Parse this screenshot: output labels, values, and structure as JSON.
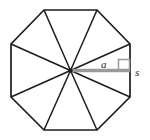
{
  "figure": {
    "name": "regular-octagon-apothem-side-diagram",
    "shape": "regular octagon",
    "sides": 8,
    "background_color": "#fefefe",
    "outline_color": "#1c1c1c",
    "radius_color": "#1c1c1c",
    "apothem_color": "#9a9a9a",
    "center": {
      "x": 70.5,
      "y": 70.5
    },
    "vertices": [
      {
        "x": 44,
        "y": 10
      },
      {
        "x": 97,
        "y": 10
      },
      {
        "x": 130,
        "y": 44
      },
      {
        "x": 130,
        "y": 97
      },
      {
        "x": 97,
        "y": 130
      },
      {
        "x": 44,
        "y": 130
      },
      {
        "x": 11,
        "y": 97
      },
      {
        "x": 11,
        "y": 44
      }
    ],
    "apothem_segment": {
      "x1": 70.5,
      "y1": 70.5,
      "x2": 130,
      "y2": 70.5
    },
    "right_angle_marker": {
      "x": 118.5,
      "y": 59,
      "size": 11
    }
  },
  "labels": {
    "apothem": "a",
    "side": "s"
  }
}
